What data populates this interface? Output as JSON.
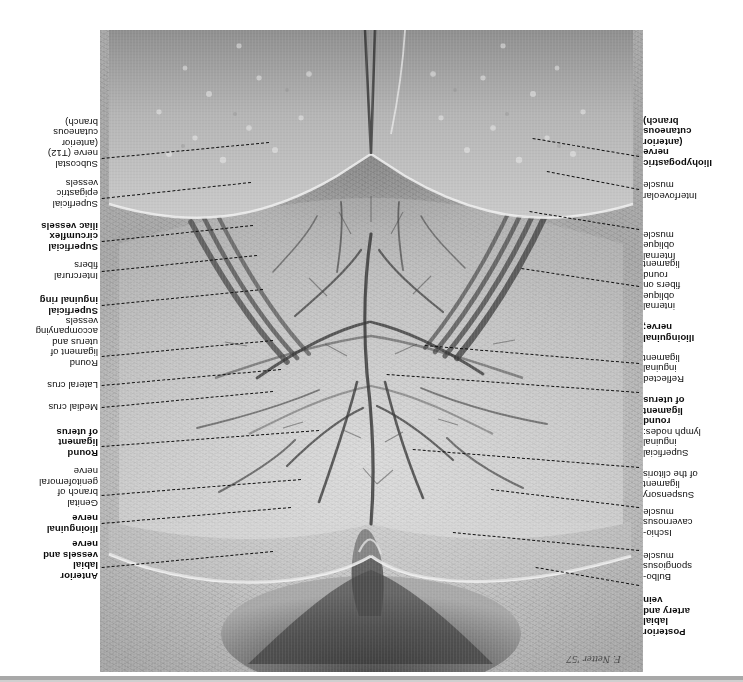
{
  "plate": {
    "signature": "F. Netter '57",
    "orientation": "rotated-180",
    "media": "anatomical illustration"
  },
  "labels_left": [
    {
      "id": "posterior-labial-artery-and-vein",
      "text": "Posterior\nlabial\nartery and\nvein",
      "bold": true,
      "top": 45,
      "right": 100,
      "line_y": 96,
      "line_x2": 207
    },
    {
      "id": "bulbospongiosus-muscle",
      "text": "Bulbo-\nspongiosus\nmuscle",
      "bold": false,
      "top": 100,
      "right": 100,
      "line_y": 131,
      "line_x2": 290
    },
    {
      "id": "ischiocavernosus-muscle",
      "text": "Ischio-\ncavernosus\nmuscle",
      "bold": false,
      "top": 144,
      "right": 100,
      "line_y": 174,
      "line_x2": 252
    },
    {
      "id": "suspensory-ligament-of-the-clitoris",
      "text": "Suspensory\nligament\nof the clitoris",
      "bold": false,
      "top": 182,
      "right": 100,
      "line_y": 214,
      "line_x2": 330
    },
    {
      "id": "superficial-inguinal-lymph-nodes-round-ligament-of-uterus",
      "text": "Superficial\ninguinal\nlymph nodes:\nround\nligament\nof uterus",
      "bold": false,
      "bold_tail": "round\nligament\nof uterus",
      "top": 224,
      "right": 100,
      "line_y": 289,
      "line_x2": 356
    },
    {
      "id": "reflected-inguinal-ligament",
      "text": "Reflected\ninguinal\nligament",
      "bold": false,
      "top": 298,
      "right": 100,
      "line_y": 318,
      "line_x2": 318
    },
    {
      "id": "ilioinguinal-nerve-internal-oblique-fibers-on-round-ligament",
      "text": "Ilioinguinal\nnerve;\ninternal\noblique\nfibers on\nround\nligament",
      "bold": false,
      "bold_head": "Ilioinguinal\nnerve;",
      "top": 339,
      "right": 100,
      "line_y": 395,
      "line_x2": 222
    },
    {
      "id": "internal-oblique-muscle",
      "text": "Internal\noblique\nmuscle",
      "bold": false,
      "top": 421,
      "right": 100,
      "line_y": 452,
      "line_x2": 214
    },
    {
      "id": "interfoveolar-muscle",
      "text": "Interfoveolar\nmuscle",
      "bold": false,
      "top": 481,
      "right": 100,
      "line_y": 492,
      "line_x2": 196
    },
    {
      "id": "iliohypogastric-nerve-anterior-cutaneous-branch",
      "text": "Iliohypogastric\nnerve\n(anterior\ncutaneous\nbranch)",
      "bold": true,
      "top": 514,
      "right": 100,
      "line_y": 525,
      "line_x2": 210
    }
  ],
  "labels_right": [
    {
      "id": "anterior-labial-vessels-and-nerve",
      "text": "Anterior\nlabial\nvessels and\nnerve",
      "bold": true,
      "top": 101,
      "left": 645,
      "line_y": 114,
      "line_x1": 470
    },
    {
      "id": "ilioinguinal-nerve",
      "text": "Ilioinguinal\nnerve",
      "bold": true,
      "top": 148,
      "left": 645,
      "line_y": 158,
      "line_x1": 452
    },
    {
      "id": "genital-branch-of-genitofemoral-nerve",
      "text": "Genital\nbranch of\ngenitofemoral\nnerve",
      "bold": false,
      "top": 174,
      "left": 645,
      "line_y": 186,
      "line_x1": 442
    },
    {
      "id": "round-ligament-of-uterus",
      "text": "Round\nligament\nof uterus",
      "bold": true,
      "top": 224,
      "left": 645,
      "line_y": 235,
      "line_x1": 424
    },
    {
      "id": "medial-crus",
      "text": "Medial crus",
      "bold": false,
      "top": 270,
      "left": 645,
      "line_y": 274,
      "line_x1": 470
    },
    {
      "id": "lateral-crus",
      "text": "Lateral crus",
      "bold": false,
      "top": 292,
      "left": 645,
      "line_y": 296,
      "line_x1": 462
    },
    {
      "id": "round-ligament-of-uterus-and-accompanying-vessels",
      "text": "Round\nligament of\nuterus and\naccompanying\nvessels",
      "bold": false,
      "top": 314,
      "left": 645,
      "line_y": 325,
      "line_x1": 470
    },
    {
      "id": "superficial-inguinal-ring",
      "text": "Superficial\ninguinal ring",
      "bold": true,
      "top": 366,
      "left": 645,
      "line_y": 376,
      "line_x1": 480
    },
    {
      "id": "intercrural-fibers",
      "text": "Intercrural\nfibers",
      "bold": false,
      "top": 401,
      "left": 645,
      "line_y": 410,
      "line_x1": 486
    },
    {
      "id": "superficial-circumflex-iliac-vessels",
      "text": "Superficial\ncircumflex\niliac vessels",
      "bold": true,
      "top": 430,
      "left": 645,
      "line_y": 440,
      "line_x1": 490
    },
    {
      "id": "superficial-epigastric-vessels",
      "text": "Superficial\nepigastric\nvessels",
      "bold": false,
      "top": 473,
      "left": 645,
      "line_y": 483,
      "line_x1": 492
    },
    {
      "id": "subcostal-nerve-t12-anterior-cutaneous-branch",
      "text": "Subcostal\nnerve (T12)\n(anterior\ncutaneous\nbranch)",
      "bold": false,
      "top": 513,
      "left": 645,
      "line_y": 523,
      "line_x1": 474
    }
  ]
}
